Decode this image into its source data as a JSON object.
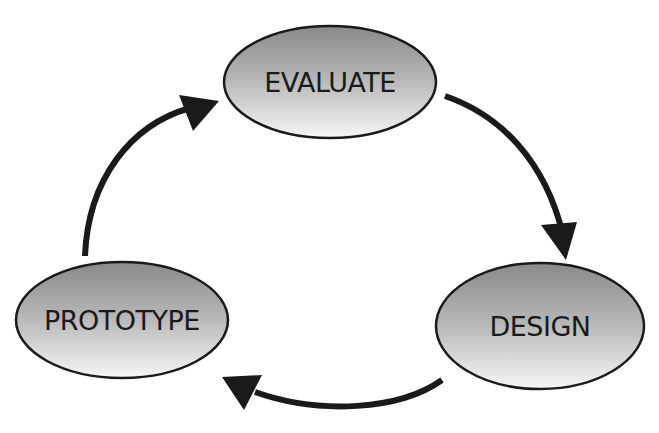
{
  "diagram": {
    "type": "cycle",
    "colors": {
      "background": "#ffffff",
      "stroke": "#1a1a1a",
      "fill_top": "#8f8f8f",
      "fill_bottom": "#f4f4f4",
      "arrow": "#1a1a1a",
      "text": "#1a1a1a"
    },
    "nodes": [
      {
        "id": "evaluate",
        "label": "EVALUATE"
      },
      {
        "id": "design",
        "label": "DESIGN"
      },
      {
        "id": "prototype",
        "label": "PROTOTYPE"
      }
    ],
    "edges": [
      {
        "from": "evaluate",
        "to": "design"
      },
      {
        "from": "design",
        "to": "prototype"
      },
      {
        "from": "prototype",
        "to": "evaluate"
      }
    ]
  }
}
